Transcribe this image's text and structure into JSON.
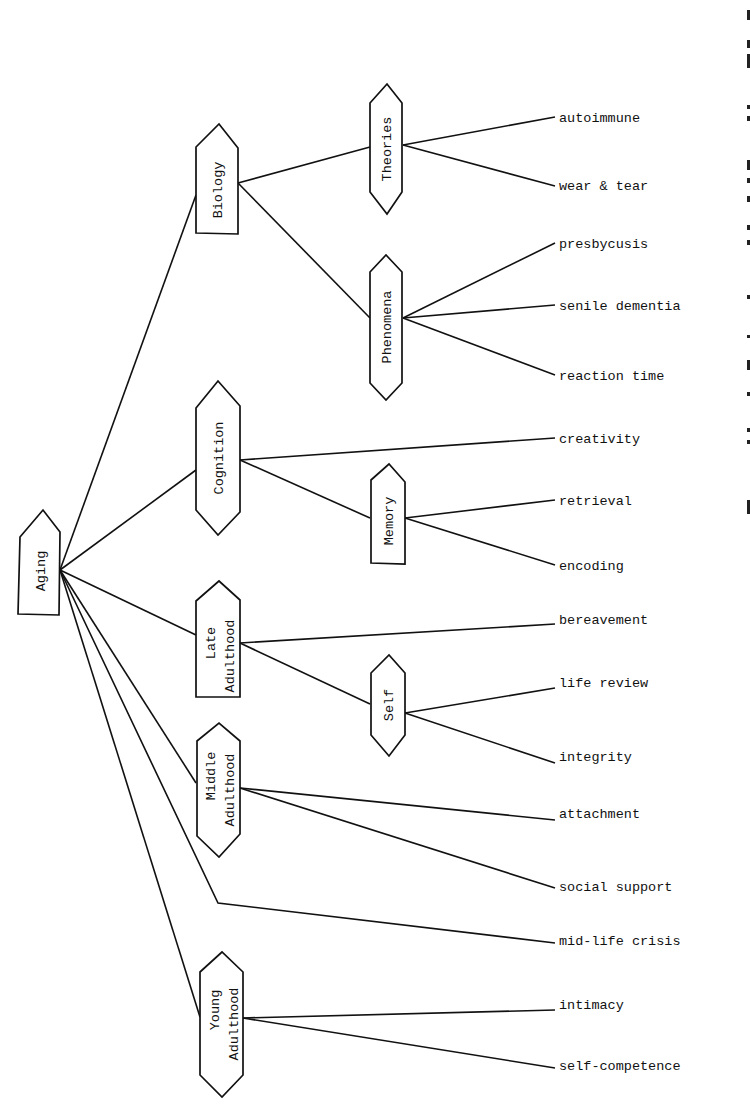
{
  "diagram": {
    "type": "tree",
    "orientation": "left-to-right",
    "root": {
      "id": "aging",
      "label": "Aging"
    },
    "categories": [
      {
        "id": "biology",
        "label": "Biology",
        "lines": [
          "Biology"
        ]
      },
      {
        "id": "cognition",
        "label": "Cognition",
        "lines": [
          "Cognition"
        ]
      },
      {
        "id": "late-adulthood",
        "label": "Late Adulthood",
        "lines": [
          "Late",
          "Adulthood"
        ]
      },
      {
        "id": "middle-adulthood",
        "label": "Middle Adulthood",
        "lines": [
          "Middle",
          "Adulthood"
        ]
      },
      {
        "id": "young-adulthood",
        "label": "Young Adulthood",
        "lines": [
          "Young",
          "Adulthood"
        ]
      }
    ],
    "subcategories": [
      {
        "id": "theories",
        "label": "Theories",
        "parent": "biology"
      },
      {
        "id": "phenomena",
        "label": "Phenomena",
        "parent": "biology"
      },
      {
        "id": "memory",
        "label": "Memory",
        "parent": "cognition"
      },
      {
        "id": "self",
        "label": "Self",
        "parent": "late-adulthood"
      }
    ],
    "leaves": [
      {
        "id": "autoimmune",
        "label": "autoimmune",
        "parent": "theories"
      },
      {
        "id": "wear-tear",
        "label": "wear & tear",
        "parent": "theories"
      },
      {
        "id": "presbycusis",
        "label": "presbycusis",
        "parent": "phenomena"
      },
      {
        "id": "senile-dementia",
        "label": "senile dementia",
        "parent": "phenomena"
      },
      {
        "id": "reaction-time",
        "label": "reaction time",
        "parent": "phenomena"
      },
      {
        "id": "creativity",
        "label": "creativity",
        "parent": "cognition"
      },
      {
        "id": "retrieval",
        "label": "retrieval",
        "parent": "memory"
      },
      {
        "id": "encoding",
        "label": "encoding",
        "parent": "memory"
      },
      {
        "id": "bereavement",
        "label": "bereavement",
        "parent": "late-adulthood"
      },
      {
        "id": "life-review",
        "label": "life review",
        "parent": "self"
      },
      {
        "id": "integrity",
        "label": "integrity",
        "parent": "self"
      },
      {
        "id": "attachment",
        "label": "attachment",
        "parent": "middle-adulthood"
      },
      {
        "id": "social-support",
        "label": "social support",
        "parent": "middle-adulthood"
      },
      {
        "id": "mid-life-crisis",
        "label": "mid-life crisis",
        "parent": "aging"
      },
      {
        "id": "intimacy",
        "label": "intimacy",
        "parent": "young-adulthood"
      },
      {
        "id": "self-competence",
        "label": "self-competence",
        "parent": "young-adulthood"
      }
    ],
    "colors": {
      "ink": "#111111",
      "background": "#ffffff"
    }
  }
}
